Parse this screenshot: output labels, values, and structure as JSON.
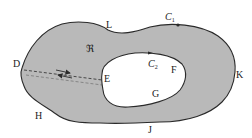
{
  "diagram": {
    "type": "multiply-connected region with cut",
    "colors": {
      "region_fill": "#b9b9b9",
      "boundary": "#2a2a2a",
      "hole_fill": "#ffffff",
      "background": "#ffffff"
    },
    "region_label": "ℜ",
    "outer_curve": {
      "name": "C",
      "subscript": "1"
    },
    "inner_curve": {
      "name": "C",
      "subscript": "2"
    },
    "points": {
      "D": "D",
      "E": "E",
      "F": "F",
      "G": "G",
      "H": "H",
      "J": "J",
      "K": "K",
      "L": "L"
    },
    "cut": {
      "from": "D",
      "to": "E",
      "style": "dashed",
      "arrows": [
        "toward E",
        "toward D"
      ]
    }
  }
}
